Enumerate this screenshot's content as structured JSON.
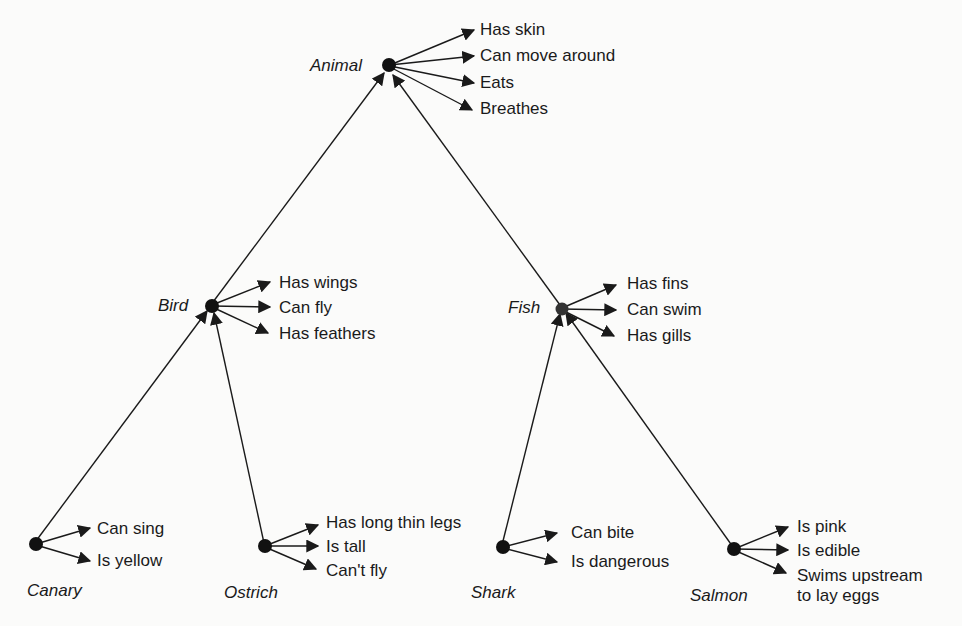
{
  "diagram": {
    "type": "semantic-network hierarchy",
    "background": "#fbfbfa",
    "ink": "#1a1a1a",
    "nodes": {
      "animal": {
        "name": "Animal",
        "properties": [
          "Has skin",
          "Can move around",
          "Eats",
          "Breathes"
        ]
      },
      "bird": {
        "name": "Bird",
        "properties": [
          "Has wings",
          "Can fly",
          "Has feathers"
        ]
      },
      "fish": {
        "name": "Fish",
        "properties": [
          "Has fins",
          "Can swim",
          "Has gills"
        ]
      },
      "canary": {
        "name": "Canary",
        "properties": [
          "Can sing",
          "Is yellow"
        ]
      },
      "ostrich": {
        "name": "Ostrich",
        "properties": [
          "Has long thin legs",
          "Is tall",
          "Can't fly"
        ]
      },
      "shark": {
        "name": "Shark",
        "properties": [
          "Can bite",
          "Is dangerous"
        ]
      },
      "salmon": {
        "name": "Salmon",
        "properties": [
          "Is pink",
          "Is edible",
          "Swims upstream",
          "to lay eggs"
        ]
      }
    },
    "edges": [
      {
        "from": "Bird",
        "to": "Animal",
        "relation": "isa"
      },
      {
        "from": "Fish",
        "to": "Animal",
        "relation": "isa"
      },
      {
        "from": "Canary",
        "to": "Bird",
        "relation": "isa"
      },
      {
        "from": "Ostrich",
        "to": "Bird",
        "relation": "isa"
      },
      {
        "from": "Shark",
        "to": "Fish",
        "relation": "isa"
      },
      {
        "from": "Salmon",
        "to": "Fish",
        "relation": "isa"
      }
    ]
  }
}
